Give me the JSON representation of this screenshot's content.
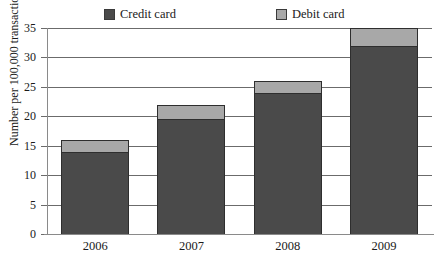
{
  "chart_data": {
    "type": "bar",
    "stacked": true,
    "title": "",
    "xlabel": "",
    "ylabel": "Number per 100,000 transactions",
    "categories": [
      "2006",
      "2007",
      "2008",
      "2009"
    ],
    "series": [
      {
        "name": "Credit card",
        "color": "#4a4a4a",
        "values": [
          14,
          19.5,
          24,
          32
        ]
      },
      {
        "name": "Debit card",
        "color": "#a8a8a8",
        "values": [
          2,
          2.5,
          2,
          3
        ]
      }
    ],
    "totals": [
      16,
      22,
      26,
      35
    ],
    "ylim": [
      0,
      35
    ],
    "ytick_values": [
      0,
      5,
      10,
      15,
      20,
      25,
      30,
      35
    ],
    "ytick_labels": [
      "0",
      "5",
      "10",
      "15",
      "20",
      "25",
      "30",
      "35"
    ],
    "grid": "horizontal",
    "legend_position": "top"
  },
  "legend": {
    "entries": [
      {
        "label": "Credit card",
        "color": "#4a4a4a"
      },
      {
        "label": "Debit card",
        "color": "#a8a8a8"
      }
    ]
  },
  "axes": {
    "y_axis_label": "Number per 100,000 transactions"
  }
}
